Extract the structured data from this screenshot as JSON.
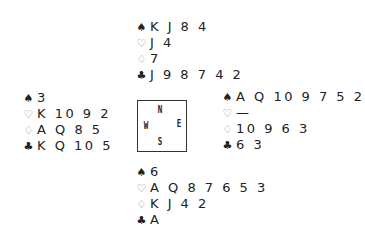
{
  "suits": {
    "spades": "♠",
    "hearts": "♡",
    "diamonds": "♢",
    "clubs": "♣"
  },
  "compass": {
    "north": "N",
    "south": "S",
    "east": "E",
    "west": "W"
  },
  "hands": {
    "north": {
      "spades": "K J 8 4",
      "hearts": "J 4",
      "diamonds": "7",
      "clubs": "J 9 8 7 4 2"
    },
    "west": {
      "spades": "3",
      "hearts": "K 10 9 2",
      "diamonds": "A Q 8 5",
      "clubs": "K Q 10 5"
    },
    "east": {
      "spades": "A Q 10 9 7 5 2",
      "hearts": "—",
      "diamonds": "10 9 6 3",
      "clubs": "6 3"
    },
    "south": {
      "spades": "6",
      "hearts": "A Q 8 7 6 5 3",
      "diamonds": "K J 4 2",
      "clubs": "A"
    }
  }
}
